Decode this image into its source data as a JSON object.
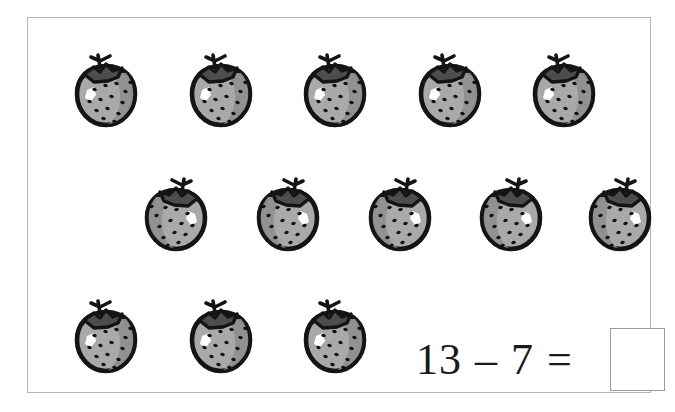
{
  "worksheet": {
    "title": "Subtraction picture worksheet",
    "background_color": "#ffffff",
    "frame_color": "#b3b3b3"
  },
  "equation": {
    "minuend": "13",
    "operator": "–",
    "subtrahend": "7",
    "equals": "=",
    "answer_value": "",
    "answer_placeholder": ""
  },
  "colors": {
    "berry_body": "#a9a9a9",
    "berry_body_shade": "#8f8f8f",
    "berry_outline": "#141414",
    "berry_leaf": "#4d4d4d",
    "berry_seed": "#111111",
    "berry_highlight": "#ffffff",
    "text": "#1a1a1a",
    "answer_box_border": "#9a9a9a"
  },
  "counts": {
    "total_berries": 13,
    "row1": 5,
    "row2": 5,
    "row3": 3
  },
  "rows": [
    {
      "name": "row-1",
      "orientation": "stem-left",
      "top": 31,
      "items": [
        {
          "label": "strawberry-1-1",
          "left": 42
        },
        {
          "label": "strawberry-1-2",
          "left": 157
        },
        {
          "label": "strawberry-1-3",
          "left": 271
        },
        {
          "label": "strawberry-1-4",
          "left": 386
        },
        {
          "label": "strawberry-1-5",
          "left": 500
        }
      ]
    },
    {
      "name": "row-2",
      "orientation": "stem-right",
      "top": 155,
      "items": [
        {
          "label": "strawberry-2-1",
          "left": 112
        },
        {
          "label": "strawberry-2-2",
          "left": 224
        },
        {
          "label": "strawberry-2-3",
          "left": 336
        },
        {
          "label": "strawberry-2-4",
          "left": 447
        },
        {
          "label": "strawberry-2-5",
          "left": 556
        }
      ]
    },
    {
      "name": "row-3",
      "orientation": "stem-left",
      "top": 277,
      "items": [
        {
          "label": "strawberry-3-1",
          "left": 42
        },
        {
          "label": "strawberry-3-2",
          "left": 157
        },
        {
          "label": "strawberry-3-3",
          "left": 271
        }
      ]
    }
  ],
  "icons": {
    "strawberry": "strawberry-icon",
    "answer_box": "answer-input-box"
  }
}
